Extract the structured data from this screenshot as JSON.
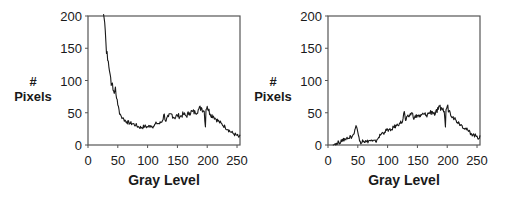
{
  "chart_data": [
    {
      "type": "line",
      "title": "",
      "xlabel": "Gray Level",
      "ylabel": "# Pixels",
      "ylabel_lines": [
        "#",
        "Pixels"
      ],
      "xlim": [
        0,
        255
      ],
      "ylim": [
        0,
        200
      ],
      "xticks": [
        0,
        50,
        100,
        150,
        200,
        250
      ],
      "yticks": [
        0,
        50,
        100,
        150,
        200
      ],
      "grid": false,
      "legend": null,
      "series": [
        {
          "name": "histogram",
          "x": [
            26,
            28,
            30,
            32,
            34,
            36,
            38,
            40,
            42,
            44,
            46,
            48,
            50,
            52,
            54,
            56,
            58,
            60,
            65,
            70,
            75,
            80,
            85,
            90,
            95,
            100,
            105,
            110,
            115,
            120,
            125,
            128,
            130,
            135,
            140,
            145,
            150,
            155,
            160,
            165,
            170,
            175,
            180,
            185,
            190,
            195,
            197,
            198,
            200,
            205,
            210,
            215,
            220,
            225,
            230,
            235,
            240,
            245,
            250,
            253,
            255
          ],
          "values": [
            205,
            190,
            160,
            145,
            130,
            115,
            105,
            95,
            85,
            80,
            90,
            72,
            62,
            55,
            48,
            44,
            42,
            40,
            36,
            34,
            33,
            31,
            28,
            27,
            29,
            28,
            30,
            29,
            34,
            33,
            38,
            48,
            37,
            44,
            48,
            42,
            46,
            44,
            48,
            45,
            50,
            52,
            50,
            55,
            58,
            52,
            28,
            55,
            60,
            48,
            45,
            40,
            36,
            32,
            28,
            24,
            20,
            17,
            15,
            12,
            16
          ]
        }
      ]
    },
    {
      "type": "line",
      "title": "",
      "xlabel": "Gray Level",
      "ylabel": "# Pixels",
      "ylabel_lines": [
        "#",
        "Pixels"
      ],
      "xlim": [
        0,
        255
      ],
      "ylim": [
        0,
        200
      ],
      "xticks": [
        0,
        50,
        100,
        150,
        200,
        250
      ],
      "yticks": [
        0,
        50,
        100,
        150,
        200
      ],
      "grid": false,
      "legend": null,
      "series": [
        {
          "name": "histogram",
          "x": [
            8,
            12,
            15,
            18,
            20,
            22,
            25,
            28,
            30,
            32,
            35,
            38,
            40,
            42,
            44,
            46,
            47,
            48,
            50,
            52,
            54,
            56,
            58,
            60,
            65,
            70,
            75,
            80,
            82,
            85,
            90,
            95,
            100,
            105,
            110,
            115,
            120,
            125,
            128,
            130,
            135,
            140,
            145,
            150,
            155,
            160,
            165,
            170,
            175,
            180,
            185,
            190,
            195,
            197,
            198,
            200,
            205,
            210,
            215,
            220,
            225,
            230,
            235,
            240,
            245,
            250,
            253,
            255
          ],
          "values": [
            0,
            2,
            1,
            5,
            3,
            8,
            6,
            10,
            8,
            12,
            10,
            14,
            12,
            16,
            18,
            26,
            30,
            28,
            20,
            12,
            6,
            3,
            8,
            6,
            5,
            7,
            6,
            5,
            8,
            12,
            18,
            20,
            24,
            22,
            28,
            30,
            34,
            36,
            52,
            38,
            44,
            50,
            42,
            46,
            44,
            48,
            46,
            50,
            52,
            48,
            55,
            58,
            52,
            28,
            55,
            60,
            50,
            44,
            38,
            34,
            30,
            26,
            22,
            18,
            15,
            14,
            10,
            15
          ]
        }
      ]
    }
  ],
  "panels": [
    {
      "ylabel_hash": "#",
      "ylabel_pixels": "Pixels",
      "xlabel": "Gray Level",
      "yticks": [
        "200",
        "150",
        "100",
        "50",
        "0"
      ],
      "xticks": [
        "0",
        "50",
        "100",
        "150",
        "200",
        "250"
      ]
    },
    {
      "ylabel_hash": "#",
      "ylabel_pixels": "Pixels",
      "xlabel": "Gray Level",
      "yticks": [
        "200",
        "150",
        "100",
        "50",
        "0"
      ],
      "xticks": [
        "0",
        "50",
        "100",
        "150",
        "200",
        "250"
      ]
    }
  ],
  "colors": {
    "line": "#1a1a1a",
    "axis": "#555555",
    "background": "#ffffff"
  }
}
